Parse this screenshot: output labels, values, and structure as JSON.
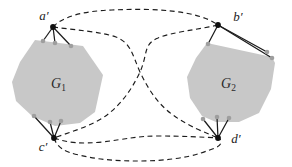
{
  "figure": {
    "background": "#ffffff",
    "ink": "#1c1c1c",
    "polygon_fill": "#c8c8c8",
    "vertex_dot_color": "#101010",
    "attachment_dot_color": "#9e9e9e"
  },
  "labels": {
    "a": "a′",
    "b": "b′",
    "c": "c′",
    "d": "d′",
    "g1_main": "G",
    "g1_sub": "1",
    "g2_main": "G",
    "g2_sub": "2"
  }
}
